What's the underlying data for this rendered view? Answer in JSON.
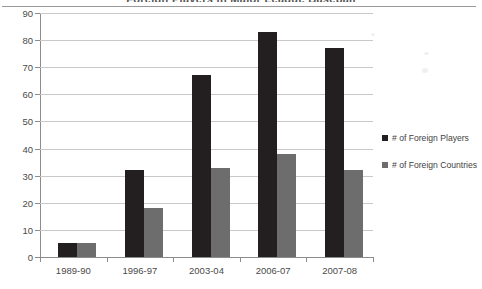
{
  "chart_data": {
    "type": "bar",
    "title": "Foreign Players in Major League Baseball",
    "title_truncated": true,
    "xlabel": "",
    "ylabel": "",
    "ylim": [
      0,
      90
    ],
    "ytick_step": 10,
    "yticks": [
      "90",
      "80",
      "70",
      "60",
      "50",
      "40",
      "30",
      "20",
      "10",
      "0"
    ],
    "grid": true,
    "legend_position": "right",
    "categories": [
      "1989-90",
      "1996-97",
      "2003-04",
      "2006-07",
      "2007-08"
    ],
    "series": [
      {
        "name": "# of Foreign Players",
        "color": "#231f20",
        "values": [
          5,
          32,
          67,
          83,
          77
        ]
      },
      {
        "name": "# of Foreign Countries",
        "color": "#6d6d6d",
        "values": [
          5,
          18,
          33,
          38,
          32
        ]
      }
    ]
  },
  "legend": {
    "items": [
      {
        "label": "# of Foreign Players",
        "swatch": "black-square-icon"
      },
      {
        "label": "# of Foreign Countries",
        "swatch": "gray-square-icon"
      }
    ]
  }
}
